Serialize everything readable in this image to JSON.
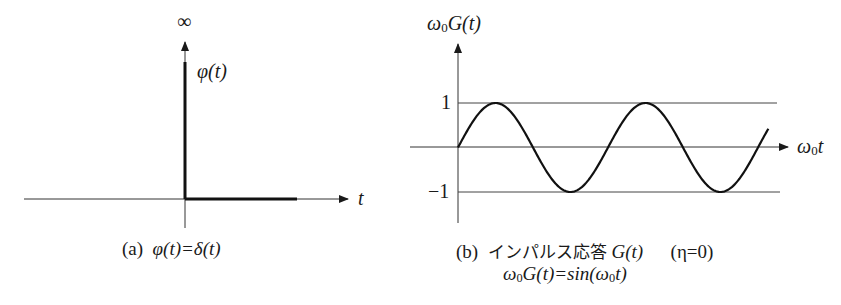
{
  "panel_a": {
    "infinity_label": "∞",
    "y_label": "φ(t)",
    "x_label": "t",
    "caption_prefix": "(a)",
    "caption_formula": "φ(t)=δ(t)"
  },
  "panel_b": {
    "y_label_omega": "ω",
    "y_label_sub": "0",
    "y_label_rest": "G(t)",
    "x_label_omega": "ω",
    "x_label_sub": "0",
    "x_label_rest": "t",
    "tick_pos": "1",
    "tick_neg": "−1",
    "caption_prefix": "(b)",
    "caption_text": "インパルス応答",
    "caption_func": "G(t)",
    "caption_param": "(η=0)",
    "caption_formula_omega": "ω",
    "caption_formula_sub": "0",
    "caption_formula_mid": "G(t)=sin(ω",
    "caption_formula_sub2": "0",
    "caption_formula_end": "t)"
  },
  "chart_data": [
    {
      "type": "line",
      "title": "(a) φ(t)=δ(t)",
      "xlabel": "t",
      "ylabel": "φ(t)",
      "annotations": [
        "∞"
      ],
      "description": "Dirac delta impulse at t=0 (spike to infinity), zero for t>0"
    },
    {
      "type": "line",
      "title": "(b) インパルス応答 G(t) (η=0)",
      "subtitle": "ω0G(t)=sin(ω0t)",
      "xlabel": "ω0t",
      "ylabel": "ω0G(t)",
      "yticks": [
        "1",
        "−1"
      ],
      "ylim": [
        -1.5,
        2.5
      ],
      "reference_lines": [
        1,
        -1
      ],
      "series": [
        {
          "name": "sin(ω0t)",
          "x": [
            0,
            1.571,
            3.142,
            4.712,
            6.283,
            7.854,
            9.425,
            10.996,
            12.566,
            13.0
          ],
          "values": [
            0,
            1,
            0,
            -1,
            0,
            1,
            0,
            -1,
            0,
            0.42
          ]
        }
      ],
      "grid": false
    }
  ]
}
